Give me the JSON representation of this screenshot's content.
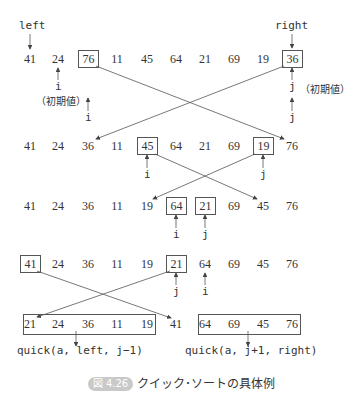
{
  "labels": {
    "left": "left",
    "right": "right",
    "i": "i",
    "j": "j",
    "initial": "（初期値）"
  },
  "rows": [
    [
      "41",
      "24",
      "76",
      "11",
      "45",
      "64",
      "21",
      "69",
      "19",
      "36"
    ],
    [
      "41",
      "24",
      "36",
      "11",
      "45",
      "64",
      "21",
      "69",
      "19",
      "76"
    ],
    [
      "41",
      "24",
      "36",
      "11",
      "19",
      "64",
      "21",
      "69",
      "45",
      "76"
    ],
    [
      "41",
      "24",
      "36",
      "11",
      "19",
      "21",
      "64",
      "69",
      "45",
      "76"
    ],
    [
      "21",
      "24",
      "36",
      "11",
      "19",
      "41",
      "64",
      "69",
      "45",
      "76"
    ]
  ],
  "calls": {
    "left_call": "quick(a, left, j−1)",
    "right_call": "quick(a, j+1, right)"
  },
  "caption": {
    "badge": "図 4.26",
    "text": "クイック･ソートの具体例"
  }
}
